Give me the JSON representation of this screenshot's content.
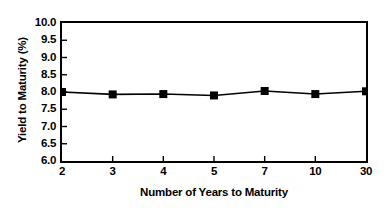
{
  "chart_data": {
    "type": "line",
    "title": "",
    "subtitle": "",
    "xlabel": "Number of Years to Maturity",
    "ylabel": "Yield to Maturity (%)",
    "categories": [
      "2",
      "3",
      "4",
      "5",
      "7",
      "10",
      "30"
    ],
    "values": [
      8.0,
      7.93,
      7.94,
      7.9,
      8.03,
      7.94,
      8.02
    ],
    "series": [
      {
        "name": "Yield to Maturity",
        "values": [
          8.0,
          7.93,
          7.94,
          7.9,
          8.03,
          7.94,
          8.02
        ]
      }
    ],
    "ylim": [
      6.0,
      10.0
    ],
    "y_ticks": [
      6.0,
      6.5,
      7.0,
      7.5,
      8.0,
      8.5,
      9.0,
      9.5,
      10.0
    ],
    "y_tick_labels": [
      "6.0",
      "6.5",
      "7.0",
      "7.5",
      "8.0",
      "8.5",
      "9.0",
      "9.5",
      "10.0"
    ],
    "x_tick_labels": [
      "2",
      "3",
      "4",
      "5",
      "7",
      "10",
      "30"
    ],
    "grid": false,
    "legend": null,
    "legend_position": "none",
    "marker": "square",
    "marker_color": "#000000",
    "line_color": "#000000",
    "frame_color": "#000000",
    "background_color": "#ffffff",
    "annotations": []
  },
  "colors": {
    "line": "#000000",
    "marker": "#000000",
    "axis": "#000000",
    "background": "#ffffff",
    "text": "#000000"
  }
}
